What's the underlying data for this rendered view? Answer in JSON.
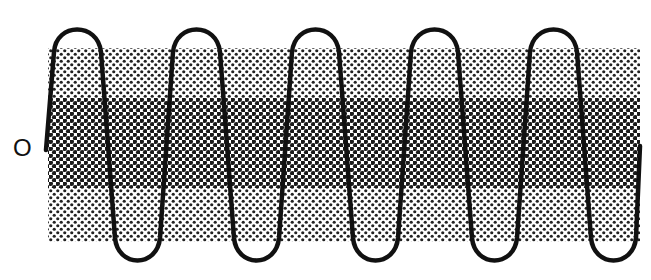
{
  "diagram": {
    "type": "waveform-over-shaded-bands",
    "baseline_label": "O",
    "colors": {
      "wave": "#111111",
      "dot": "#222222",
      "background": "#ffffff"
    },
    "bands": [
      {
        "name": "upper-light-band",
        "density": "light"
      },
      {
        "name": "middle-dark-band",
        "density": "dark"
      },
      {
        "name": "lower-light-band",
        "density": "light"
      }
    ],
    "wave": {
      "peaks": 5,
      "troughs": 5
    }
  }
}
